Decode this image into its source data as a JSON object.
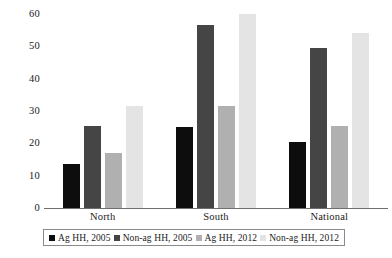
{
  "chart_data": {
    "type": "bar",
    "title": "",
    "subtitle": "",
    "xlabel": "",
    "ylabel": "",
    "ylim": [
      0,
      60
    ],
    "yticks": [
      0,
      10,
      20,
      30,
      40,
      50,
      60
    ],
    "grid": false,
    "legend_position": "bottom",
    "categories": [
      "North",
      "South",
      "National"
    ],
    "series": [
      {
        "name": "Ag HH, 2005",
        "color": "#0d0d0d",
        "values": [
          13.5,
          25.0,
          20.5
        ]
      },
      {
        "name": "Non-ag HH, 2005",
        "color": "#454545",
        "values": [
          25.5,
          56.5,
          49.5
        ]
      },
      {
        "name": "Ag HH, 2012",
        "color": "#b0b0b0",
        "values": [
          17.0,
          31.5,
          25.5
        ]
      },
      {
        "name": "Non-ag HH, 2012",
        "color": "#e4e4e4",
        "values": [
          31.5,
          60.0,
          54.0
        ]
      }
    ]
  }
}
